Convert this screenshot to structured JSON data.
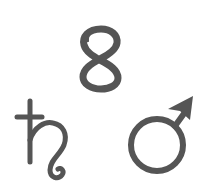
{
  "symbols": [
    {
      "id": "eight",
      "glyph": "8",
      "meaning": "number eight"
    },
    {
      "id": "saturn",
      "glyph": "♄",
      "meaning": "Saturn"
    },
    {
      "id": "mars",
      "glyph": "♂",
      "meaning": "Mars / male"
    }
  ],
  "colors": {
    "ink": "#555555",
    "background": "#ffffff"
  }
}
